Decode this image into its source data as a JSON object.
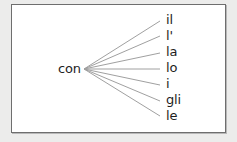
{
  "diagram": {
    "root": "con",
    "branches": [
      "il",
      "l'",
      "la",
      "lo",
      "i",
      "gli",
      "le"
    ],
    "colors": {
      "background": "#ececeb",
      "box": "#ffffff",
      "border": "#6e6e6e",
      "lines": "#a0a0a0",
      "text": "#1e1e1e"
    }
  }
}
